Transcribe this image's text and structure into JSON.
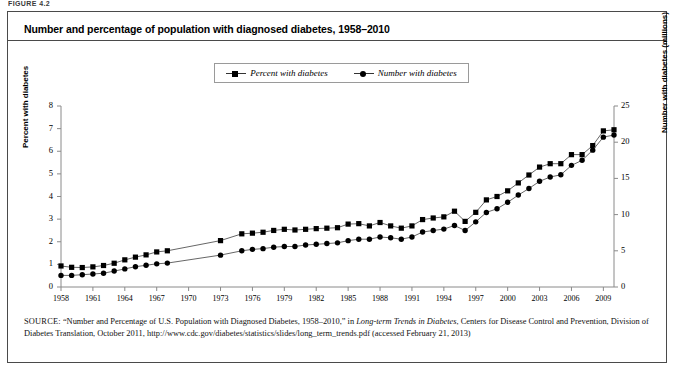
{
  "figure_label": "FIGURE 4.2",
  "title": "Number and percentage of population with diagnosed diabetes, 1958–2010",
  "legend": {
    "items": [
      {
        "label": "Percent with diabetes",
        "marker": "square-marker-icon",
        "color": "#000000"
      },
      {
        "label": "Number with diabetes",
        "marker": "circle-marker-icon",
        "color": "#000000"
      }
    ]
  },
  "axes": {
    "left_title": "Percent with diabetes",
    "right_title": "Number with diabetes (millions)",
    "left_ticks": [
      "0",
      "1",
      "2",
      "3",
      "4",
      "5",
      "6",
      "7",
      "8"
    ],
    "right_ticks": [
      "0",
      "5",
      "10",
      "15",
      "20",
      "25"
    ],
    "x_ticks": [
      "1958",
      "1961",
      "1964",
      "1967",
      "1970",
      "1973",
      "1976",
      "1979",
      "1982",
      "1985",
      "1988",
      "1991",
      "1994",
      "1997",
      "2000",
      "2003",
      "2006",
      "2009"
    ]
  },
  "source": {
    "prefix": "SOURCE:",
    "text_1": " “Number and Percentage of U.S. Population with Diagnosed Diabetes, 1958–2010,” in ",
    "italic_1": "Long-term Trends in Diabetes",
    "text_2": ", Centers for Disease Control and Prevention, Division of Diabetes Translation, October 2011, http://www.cdc.gov/diabetes/statistics/slides/long_term_trends.pdf (accessed February 21, 2013)"
  },
  "chart_data": {
    "type": "line",
    "title": "Number and percentage of population with diagnosed diabetes, 1958–2010",
    "xlabel": "",
    "ylabel": "Percent with diabetes",
    "y2label": "Number with diabetes (millions)",
    "xlim": [
      1958,
      2010
    ],
    "ylim": [
      0,
      8
    ],
    "y2lim": [
      0,
      25
    ],
    "grid": false,
    "legend_position": "top-center",
    "x": [
      1958,
      1959,
      1960,
      1961,
      1962,
      1963,
      1964,
      1965,
      1966,
      1967,
      1968,
      1973,
      1975,
      1976,
      1977,
      1978,
      1979,
      1980,
      1981,
      1982,
      1983,
      1984,
      1985,
      1986,
      1987,
      1988,
      1989,
      1990,
      1991,
      1992,
      1993,
      1994,
      1995,
      1996,
      1997,
      1998,
      1999,
      2000,
      2001,
      2002,
      2003,
      2004,
      2005,
      2006,
      2007,
      2008,
      2009,
      2010
    ],
    "series": [
      {
        "name": "Percent with diabetes",
        "axis": "left",
        "units": "percent",
        "marker": "square",
        "values": [
          0.93,
          0.87,
          0.86,
          0.89,
          0.95,
          1.05,
          1.2,
          1.32,
          1.42,
          1.55,
          1.6,
          2.05,
          2.35,
          2.38,
          2.42,
          2.5,
          2.55,
          2.52,
          2.55,
          2.58,
          2.6,
          2.62,
          2.78,
          2.8,
          2.7,
          2.85,
          2.7,
          2.6,
          2.7,
          2.98,
          3.05,
          3.1,
          3.35,
          2.9,
          3.3,
          3.85,
          4.0,
          4.25,
          4.6,
          4.95,
          5.3,
          5.45,
          5.45,
          5.85,
          5.85,
          6.25,
          6.9,
          6.95
        ]
      },
      {
        "name": "Number with diabetes",
        "axis": "right",
        "units": "millions",
        "marker": "circle",
        "values": [
          1.6,
          1.6,
          1.7,
          1.8,
          1.9,
          2.2,
          2.5,
          2.8,
          3.0,
          3.2,
          3.3,
          4.4,
          5.0,
          5.2,
          5.3,
          5.5,
          5.6,
          5.6,
          5.8,
          5.9,
          6.0,
          6.1,
          6.4,
          6.6,
          6.6,
          6.9,
          6.8,
          6.6,
          6.9,
          7.6,
          7.8,
          8.0,
          8.5,
          7.8,
          9.0,
          10.3,
          10.8,
          11.7,
          12.7,
          13.6,
          14.6,
          15.2,
          15.5,
          16.8,
          17.5,
          18.9,
          20.7,
          21.0
        ]
      }
    ]
  }
}
